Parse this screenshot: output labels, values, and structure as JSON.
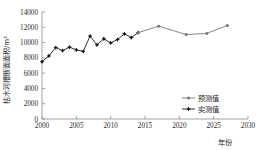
{
  "chart_data": {
    "type": "line",
    "title": "",
    "xlabel": "年份",
    "ylabel": "枯水河槽断面面积/m²",
    "xlim": [
      2000,
      2030
    ],
    "ylim": [
      0,
      14000
    ],
    "xticks": [
      "2000",
      "2005",
      "2010",
      "2015",
      "2020",
      "2025",
      "2030"
    ],
    "yticks": [
      "0",
      "2000",
      "4000",
      "6000",
      "8000",
      "10000",
      "12000",
      "14000"
    ],
    "grid": false,
    "legend_position": "center-right",
    "series": [
      {
        "name": "实测值",
        "color": "#1a1a1a",
        "marker": "plus-cross",
        "x": [
          2000,
          2001,
          2002,
          2003,
          2004,
          2005,
          2006,
          2007,
          2008,
          2009,
          2010,
          2011,
          2012,
          2013,
          2014
        ],
        "values": [
          7500,
          8250,
          9350,
          8950,
          9400,
          9050,
          8850,
          10850,
          9700,
          10500,
          9950,
          10400,
          11150,
          10650,
          11300
        ]
      },
      {
        "name": "预测值",
        "color": "#777777",
        "marker": "dot",
        "x": [
          2014,
          2017,
          2021,
          2024,
          2027
        ],
        "values": [
          11300,
          12150,
          11050,
          11200,
          12250
        ]
      }
    ],
    "legend": [
      {
        "label": "预测值",
        "color": "#777777"
      },
      {
        "label": "实测值",
        "color": "#1a1a1a"
      }
    ]
  }
}
